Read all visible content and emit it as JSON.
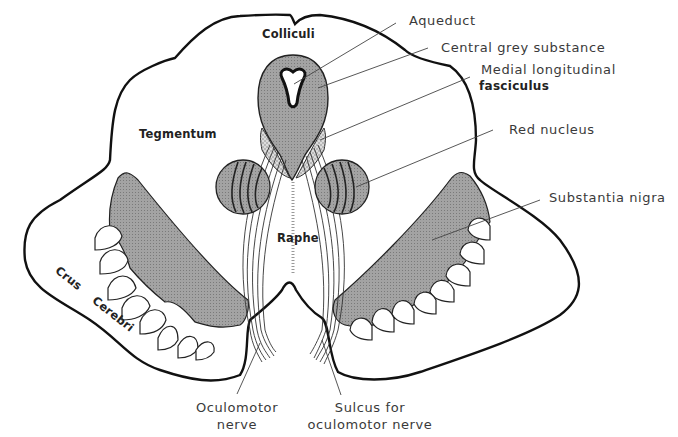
{
  "diagram": {
    "colors": {
      "outline": "#111111",
      "shaded_region": "#9a9a9a",
      "stippled_region": "#c8c8c8",
      "leader_line": "#444444",
      "background": "#ffffff"
    },
    "labels": {
      "colliculi": "Colliculi",
      "aqueduct": "Aqueduct",
      "central_grey": "Central grey substance",
      "mlf_line1": "Medial longitudinal",
      "mlf_line2": "fasciculus",
      "tegmentum": "Tegmentum",
      "red_nucleus": "Red nucleus",
      "substantia_nigra": "Substantia nigra",
      "raphe": "Raphe",
      "crus": "Crus",
      "cerebri": "Cerebri",
      "oculomotor_line1": "Oculomotor",
      "oculomotor_line2": "nerve",
      "sulcus_line1": "Sulcus for",
      "sulcus_line2": "oculomotor nerve"
    }
  }
}
